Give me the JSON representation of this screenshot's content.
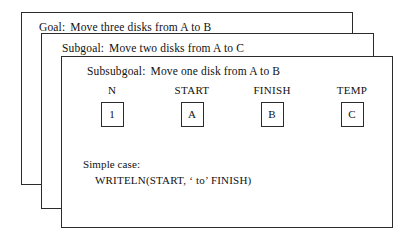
{
  "diagram": {
    "background_color": "#ffffff",
    "line_color": "#2b2b2b"
  },
  "cards": {
    "goal": {
      "label": "Goal:",
      "text": "Move three disks from A to B"
    },
    "subgoal": {
      "label": "Subgoal:",
      "text": "Move two disks from A to C"
    },
    "subsubgoal": {
      "label": "Subsubgoal:",
      "text": "Move one disk from A to B"
    }
  },
  "parameters": {
    "columns": [
      {
        "header": "N",
        "value": "1"
      },
      {
        "header": "START",
        "value": "A"
      },
      {
        "header": "FINISH",
        "value": "B"
      },
      {
        "header": "TEMP",
        "value": "C"
      }
    ]
  },
  "simple_case": {
    "label": "Simple case:",
    "code": "WRITELN(START, ‘ to’  FINISH)"
  }
}
